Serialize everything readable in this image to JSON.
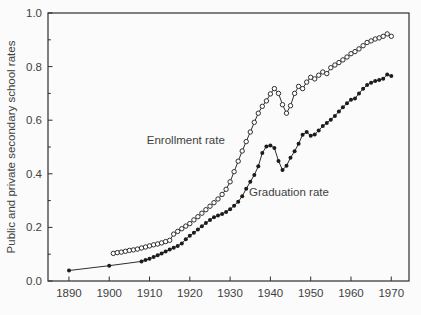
{
  "figure": {
    "background": "#fbfbfb",
    "axis_color": "#2e2e2e",
    "text_color": "#3f3f3f",
    "open_marker_fill": "#ffffff",
    "filled_marker_fill": "#1c1c1c"
  },
  "chart_data": {
    "type": "line",
    "title": "",
    "xlabel": "",
    "ylabel": "Public and private secondary school rates",
    "xlim": [
      1884.8,
      1974.4
    ],
    "ylim": [
      0,
      1.0
    ],
    "grid": false,
    "legend_position": "none",
    "x_ticks": [
      1890,
      1900,
      1910,
      1920,
      1930,
      1940,
      1950,
      1960,
      1970
    ],
    "y_major_ticks": [
      0.0,
      0.2,
      0.4,
      0.6,
      0.8,
      1.0
    ],
    "y_major_tick_labels": [
      "0.0",
      "0.2",
      "0.4",
      "0.6",
      "0.8",
      "1.0"
    ],
    "y_minor_ticks": [
      0.1,
      0.3,
      0.5,
      0.7,
      0.9
    ],
    "annotations": [
      {
        "id": "enrollment-label",
        "text": "Enrollment rate",
        "x": 1919.0,
        "y": 0.526
      },
      {
        "id": "graduation-label",
        "text": "Graduation rate",
        "x": 1944.6,
        "y": 0.332
      }
    ],
    "series": [
      {
        "name": "Enrollment rate",
        "marker": "open-circle",
        "points": [
          [
            1901,
            0.103
          ],
          [
            1902,
            0.106
          ],
          [
            1903,
            0.108
          ],
          [
            1904,
            0.111
          ],
          [
            1905,
            0.114
          ],
          [
            1906,
            0.116
          ],
          [
            1907,
            0.119
          ],
          [
            1908,
            0.123
          ],
          [
            1909,
            0.127
          ],
          [
            1910,
            0.131
          ],
          [
            1911,
            0.135
          ],
          [
            1912,
            0.138
          ],
          [
            1913,
            0.142
          ],
          [
            1914,
            0.147
          ],
          [
            1915,
            0.152
          ],
          [
            1916,
            0.175
          ],
          [
            1917,
            0.185
          ],
          [
            1918,
            0.195
          ],
          [
            1919,
            0.205
          ],
          [
            1920,
            0.214
          ],
          [
            1921,
            0.228
          ],
          [
            1922,
            0.24
          ],
          [
            1923,
            0.253
          ],
          [
            1924,
            0.266
          ],
          [
            1925,
            0.279
          ],
          [
            1926,
            0.292
          ],
          [
            1927,
            0.306
          ],
          [
            1928,
            0.323
          ],
          [
            1929,
            0.342
          ],
          [
            1930,
            0.37
          ],
          [
            1931,
            0.408
          ],
          [
            1932,
            0.447
          ],
          [
            1933,
            0.485
          ],
          [
            1934,
            0.52
          ],
          [
            1935,
            0.556
          ],
          [
            1936,
            0.592
          ],
          [
            1937,
            0.626
          ],
          [
            1938,
            0.652
          ],
          [
            1939,
            0.672
          ],
          [
            1940,
            0.698
          ],
          [
            1941,
            0.718
          ],
          [
            1942,
            0.7
          ],
          [
            1943,
            0.658
          ],
          [
            1944,
            0.626
          ],
          [
            1945,
            0.654
          ],
          [
            1946,
            0.7
          ],
          [
            1947,
            0.726
          ],
          [
            1948,
            0.718
          ],
          [
            1949,
            0.742
          ],
          [
            1950,
            0.76
          ],
          [
            1951,
            0.754
          ],
          [
            1952,
            0.768
          ],
          [
            1953,
            0.78
          ],
          [
            1954,
            0.774
          ],
          [
            1955,
            0.796
          ],
          [
            1956,
            0.806
          ],
          [
            1957,
            0.815
          ],
          [
            1958,
            0.825
          ],
          [
            1959,
            0.836
          ],
          [
            1960,
            0.848
          ],
          [
            1961,
            0.856
          ],
          [
            1962,
            0.866
          ],
          [
            1963,
            0.878
          ],
          [
            1964,
            0.89
          ],
          [
            1965,
            0.896
          ],
          [
            1966,
            0.903
          ],
          [
            1967,
            0.907
          ],
          [
            1968,
            0.913
          ],
          [
            1969,
            0.922
          ],
          [
            1970,
            0.913
          ]
        ]
      },
      {
        "name": "Graduation rate",
        "marker": "filled-circle",
        "points": [
          [
            1890,
            0.039
          ],
          [
            1900,
            0.057
          ],
          [
            1908,
            0.073
          ],
          [
            1909,
            0.078
          ],
          [
            1910,
            0.083
          ],
          [
            1911,
            0.089
          ],
          [
            1912,
            0.096
          ],
          [
            1913,
            0.103
          ],
          [
            1914,
            0.11
          ],
          [
            1915,
            0.117
          ],
          [
            1916,
            0.124
          ],
          [
            1917,
            0.131
          ],
          [
            1918,
            0.14
          ],
          [
            1919,
            0.156
          ],
          [
            1920,
            0.169
          ],
          [
            1921,
            0.18
          ],
          [
            1922,
            0.192
          ],
          [
            1923,
            0.204
          ],
          [
            1924,
            0.216
          ],
          [
            1925,
            0.228
          ],
          [
            1926,
            0.238
          ],
          [
            1927,
            0.244
          ],
          [
            1928,
            0.25
          ],
          [
            1929,
            0.258
          ],
          [
            1930,
            0.268
          ],
          [
            1931,
            0.281
          ],
          [
            1932,
            0.296
          ],
          [
            1933,
            0.316
          ],
          [
            1934,
            0.344
          ],
          [
            1935,
            0.37
          ],
          [
            1936,
            0.396
          ],
          [
            1937,
            0.428
          ],
          [
            1938,
            0.478
          ],
          [
            1939,
            0.502
          ],
          [
            1940,
            0.506
          ],
          [
            1941,
            0.496
          ],
          [
            1942,
            0.448
          ],
          [
            1943,
            0.414
          ],
          [
            1944,
            0.43
          ],
          [
            1945,
            0.46
          ],
          [
            1946,
            0.484
          ],
          [
            1947,
            0.512
          ],
          [
            1948,
            0.546
          ],
          [
            1949,
            0.556
          ],
          [
            1950,
            0.542
          ],
          [
            1951,
            0.547
          ],
          [
            1952,
            0.562
          ],
          [
            1953,
            0.578
          ],
          [
            1954,
            0.59
          ],
          [
            1955,
            0.602
          ],
          [
            1956,
            0.616
          ],
          [
            1957,
            0.632
          ],
          [
            1958,
            0.648
          ],
          [
            1959,
            0.663
          ],
          [
            1960,
            0.676
          ],
          [
            1961,
            0.681
          ],
          [
            1962,
            0.7
          ],
          [
            1963,
            0.717
          ],
          [
            1964,
            0.731
          ],
          [
            1965,
            0.74
          ],
          [
            1966,
            0.746
          ],
          [
            1967,
            0.75
          ],
          [
            1968,
            0.755
          ],
          [
            1969,
            0.77
          ],
          [
            1970,
            0.765
          ]
        ]
      }
    ]
  }
}
